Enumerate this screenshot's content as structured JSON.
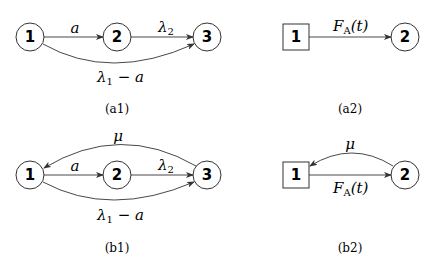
{
  "panels": {
    "a1": {
      "caption": "(a1)",
      "nodes": [
        {
          "id": "1",
          "label": "1",
          "shape": "circle"
        },
        {
          "id": "2",
          "label": "2",
          "shape": "circle"
        },
        {
          "id": "3",
          "label": "3",
          "shape": "circle"
        }
      ],
      "edges": [
        {
          "from": "1",
          "to": "2",
          "label": "a"
        },
        {
          "from": "2",
          "to": "3",
          "label": "λ",
          "label_sub": "2"
        },
        {
          "from": "1",
          "to": "3",
          "label": "λ",
          "label_sub": "1",
          "label_suffix": " − a",
          "curved": true
        }
      ]
    },
    "a2": {
      "caption": "(a2)",
      "nodes": [
        {
          "id": "1",
          "label": "1",
          "shape": "square"
        },
        {
          "id": "2",
          "label": "2",
          "shape": "circle"
        }
      ],
      "edges": [
        {
          "from": "1",
          "to": "2",
          "label": "F",
          "label_sub": "A",
          "label_suffix": "(t)"
        }
      ]
    },
    "b1": {
      "caption": "(b1)",
      "nodes": [
        {
          "id": "1",
          "label": "1",
          "shape": "circle"
        },
        {
          "id": "2",
          "label": "2",
          "shape": "circle"
        },
        {
          "id": "3",
          "label": "3",
          "shape": "circle"
        }
      ],
      "edges": [
        {
          "from": "1",
          "to": "2",
          "label": "a"
        },
        {
          "from": "2",
          "to": "3",
          "label": "λ",
          "label_sub": "2"
        },
        {
          "from": "1",
          "to": "3",
          "label": "λ",
          "label_sub": "1",
          "label_suffix": " − a",
          "curved": true
        },
        {
          "from": "3",
          "to": "1",
          "label": "μ",
          "curved": true
        }
      ]
    },
    "b2": {
      "caption": "(b2)",
      "nodes": [
        {
          "id": "1",
          "label": "1",
          "shape": "square"
        },
        {
          "id": "2",
          "label": "2",
          "shape": "circle"
        }
      ],
      "edges": [
        {
          "from": "1",
          "to": "2",
          "label": "F",
          "label_sub": "A",
          "label_suffix": "(t)"
        },
        {
          "from": "2",
          "to": "1",
          "label": "μ",
          "curved": true
        }
      ]
    }
  }
}
